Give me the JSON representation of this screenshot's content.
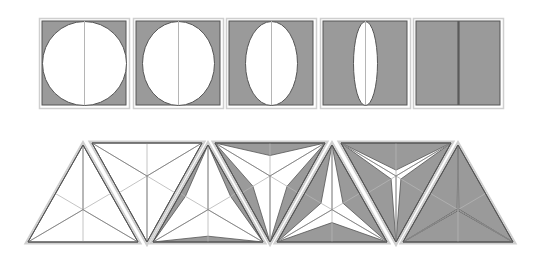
{
  "diagram": {
    "colors": {
      "background": "#ffffff",
      "fill_gray": "#9a9a9a",
      "stroke_dark": "#555555",
      "outline_light": "#cfcfcf",
      "median_line": "#b5b5b5",
      "white": "#ffffff"
    },
    "squares": {
      "size": 90,
      "inner_inset": 3,
      "y": 18,
      "items": [
        {
          "x": 39,
          "ellipse_rx": 42,
          "ellipse_ry": 42
        },
        {
          "x": 133,
          "ellipse_rx": 36,
          "ellipse_ry": 42
        },
        {
          "x": 226,
          "ellipse_rx": 26,
          "ellipse_ry": 42
        },
        {
          "x": 320,
          "ellipse_rx": 12,
          "ellipse_ry": 42
        },
        {
          "x": 413,
          "ellipse_rx": 0,
          "ellipse_ry": 42
        }
      ]
    },
    "triangles": {
      "width": 110,
      "height": 97,
      "top_y": 145,
      "base_y": 242,
      "items": [
        {
          "orientation": "up",
          "cx": 83,
          "star_t": 0.0
        },
        {
          "orientation": "down",
          "cx": 147,
          "star_t": 0.0
        },
        {
          "orientation": "up",
          "cx": 208,
          "star_t": 0.18
        },
        {
          "orientation": "down",
          "cx": 270,
          "star_t": 0.38
        },
        {
          "orientation": "up",
          "cx": 332,
          "star_t": 0.6
        },
        {
          "orientation": "down",
          "cx": 396,
          "star_t": 0.82
        },
        {
          "orientation": "up",
          "cx": 458,
          "star_t": 0.97
        }
      ]
    }
  }
}
